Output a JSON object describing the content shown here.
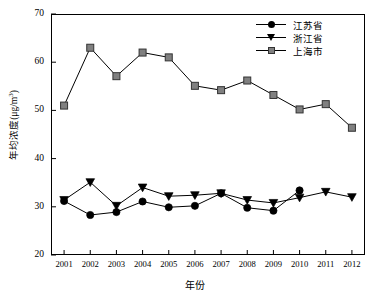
{
  "chart_data": {
    "type": "line",
    "title": "",
    "xlabel": "年份",
    "ylabel": "年均浓度(μg/m³)",
    "ylabel_main": "年均浓度(",
    "ylabel_unit": "μg/m",
    "ylabel_exp": "3",
    "ylabel_close": ")",
    "categories": [
      "2001",
      "2002",
      "2003",
      "2004",
      "2005",
      "2006",
      "2007",
      "2008",
      "2009",
      "2010",
      "2011",
      "2012"
    ],
    "x": [
      2001,
      2002,
      2003,
      2004,
      2005,
      2006,
      2007,
      2008,
      2009,
      2010,
      2011,
      2012
    ],
    "xlim": [
      2000.5,
      2012.5
    ],
    "ylim": [
      20,
      70
    ],
    "yticks": [
      20,
      30,
      40,
      50,
      60,
      70
    ],
    "grid": false,
    "legend_position": "top-right",
    "series": [
      {
        "name": "江苏省",
        "marker": "circle",
        "color": "#000000",
        "values": [
          31.2,
          28.3,
          28.9,
          31.1,
          29.9,
          30.2,
          32.8,
          29.8,
          29.2,
          33.4,
          null,
          null
        ]
      },
      {
        "name": "浙江省",
        "marker": "triangle-down",
        "color": "#000000",
        "values": [
          31.4,
          35.1,
          30.2,
          34.0,
          32.2,
          32.4,
          32.8,
          31.4,
          30.8,
          31.9,
          33.1,
          32.0
        ]
      },
      {
        "name": "上海市",
        "marker": "square",
        "color": "#808080",
        "values": [
          51.0,
          63.0,
          57.1,
          62.0,
          61.0,
          55.1,
          54.2,
          56.2,
          53.2,
          50.2,
          51.3,
          46.4
        ]
      }
    ]
  },
  "legend": {
    "items": [
      {
        "label": "江苏省",
        "marker": "circle"
      },
      {
        "label": "浙江省",
        "marker": "triangle-down"
      },
      {
        "label": "上海市",
        "marker": "square"
      }
    ]
  }
}
